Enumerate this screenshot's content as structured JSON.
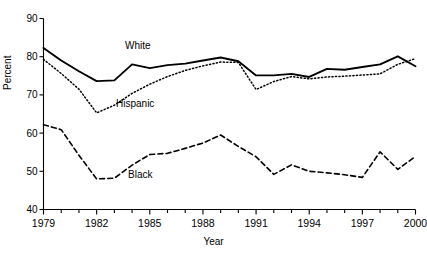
{
  "chart_data": {
    "type": "line",
    "title": "",
    "xlabel": "Year",
    "ylabel": "Percent",
    "xlim": [
      1979,
      2000
    ],
    "ylim": [
      40,
      90
    ],
    "ytick_values": [
      40,
      50,
      60,
      70,
      80,
      90
    ],
    "ytick_labels": [
      "40",
      "50",
      "60",
      "70",
      "80",
      "90"
    ],
    "xtick_values": [
      1979,
      1980,
      1981,
      1982,
      1983,
      1984,
      1985,
      1986,
      1987,
      1988,
      1989,
      1990,
      1991,
      1992,
      1993,
      1994,
      1995,
      1996,
      1997,
      1998,
      1999,
      2000
    ],
    "xtick_labels_shown": [
      "1979",
      "1982",
      "1985",
      "1988",
      "1991",
      "1994",
      "1997",
      "2000"
    ],
    "xtick_labeled_values": [
      1979,
      1982,
      1985,
      1988,
      1991,
      1994,
      1997,
      2000
    ],
    "grid": false,
    "legend_position": "inline-annotations",
    "x": [
      1979,
      1980,
      1981,
      1982,
      1983,
      1984,
      1985,
      1986,
      1987,
      1988,
      1989,
      1990,
      1991,
      1992,
      1993,
      1994,
      1995,
      1996,
      1997,
      1998,
      1999,
      2000
    ],
    "series": [
      {
        "name": "White",
        "style": "solid",
        "color": "#000000",
        "label_text": "White",
        "values": [
          82.3,
          79.0,
          76.2,
          73.6,
          73.8,
          78.0,
          77.0,
          77.8,
          78.2,
          79.0,
          79.8,
          78.8,
          75.1,
          75.1,
          75.5,
          74.7,
          76.8,
          76.6,
          77.3,
          78.0,
          80.1,
          77.5
        ]
      },
      {
        "name": "Hispanic",
        "style": "dotted",
        "color": "#000000",
        "label_text": "Hispanic",
        "values": [
          79.3,
          75.6,
          71.5,
          65.3,
          67.3,
          70.4,
          72.8,
          74.8,
          76.4,
          77.6,
          78.6,
          78.5,
          71.4,
          73.5,
          74.8,
          74.2,
          74.7,
          74.9,
          75.2,
          75.5,
          78.0,
          79.5
        ]
      },
      {
        "name": "Black",
        "style": "dashed",
        "color": "#000000",
        "label_text": "Black",
        "values": [
          62.2,
          60.9,
          54.2,
          48.0,
          48.2,
          51.6,
          54.4,
          54.7,
          56.0,
          57.4,
          59.5,
          56.5,
          53.8,
          49.2,
          51.7,
          50.0,
          49.6,
          49.1,
          48.4,
          55.1,
          50.5,
          53.9
        ]
      }
    ]
  },
  "labels": {
    "ylabel": "Percent",
    "xlabel": "Year",
    "white": "White",
    "hispanic": "Hispanic",
    "black": "Black"
  }
}
